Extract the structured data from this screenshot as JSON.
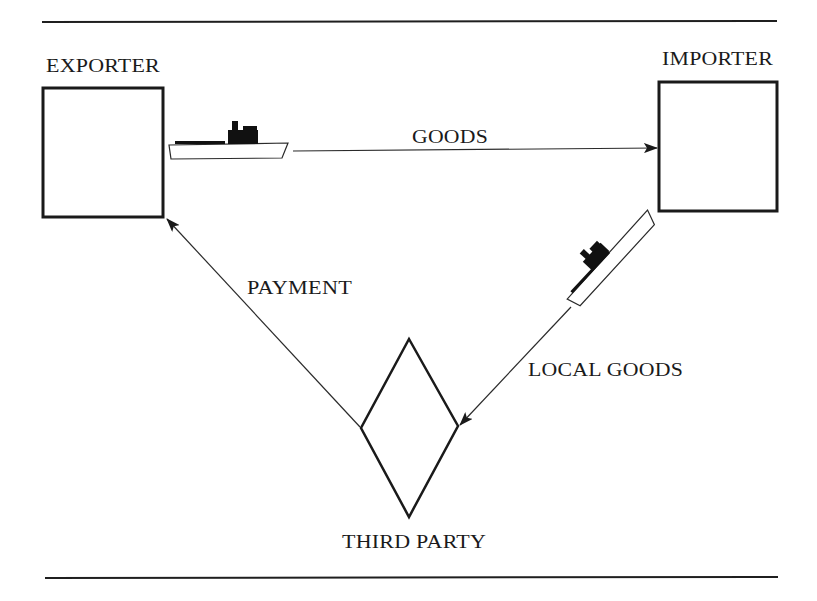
{
  "diagram": {
    "type": "flow-diagram",
    "nodes": {
      "exporter": {
        "label": "EXPORTER",
        "shape": "rectangle"
      },
      "importer": {
        "label": "IMPORTER",
        "shape": "rectangle"
      },
      "third_party": {
        "label": "THIRD PARTY",
        "shape": "diamond"
      }
    },
    "edges": {
      "goods": {
        "label": "GOODS",
        "from": "EXPORTER",
        "to": "IMPORTER",
        "icon": "ship-icon"
      },
      "local_goods": {
        "label": "LOCAL GOODS",
        "from": "IMPORTER",
        "to": "THIRD PARTY",
        "icon": "ship-icon"
      },
      "payment": {
        "label": "PAYMENT",
        "from": "THIRD PARTY",
        "to": "EXPORTER"
      }
    },
    "colors": {
      "ink": "#1a1a1a",
      "background": "#ffffff"
    }
  }
}
